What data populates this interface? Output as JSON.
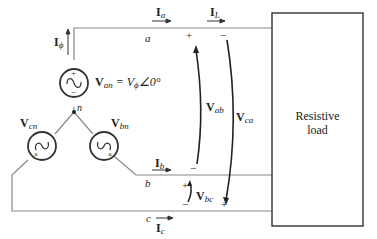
{
  "diagram": {
    "load_label_line1": "Resistive",
    "load_label_line2": "load",
    "node_a": "a",
    "node_b": "b",
    "node_c": "c",
    "node_n": "n",
    "currents": {
      "I_phi": {
        "main": "I",
        "sub": "ϕ"
      },
      "I_a": {
        "main": "I",
        "sub": "a"
      },
      "I_L": {
        "main": "I",
        "sub": "L"
      },
      "I_b": {
        "main": "I",
        "sub": "b"
      },
      "I_c": {
        "main": "I",
        "sub": "c"
      }
    },
    "voltages": {
      "V_an": {
        "main": "V",
        "sub": "an",
        "eq": " = V",
        "eq_sub": "ϕ",
        "angle": "∠0°"
      },
      "V_bn": {
        "main": "V",
        "sub": "bn"
      },
      "V_cn": {
        "main": "V",
        "sub": "cn"
      },
      "V_ab": {
        "main": "V",
        "sub": "ab"
      },
      "V_ca": {
        "main": "V",
        "sub": "ca"
      },
      "V_bc": {
        "main": "V",
        "sub": "bc"
      }
    },
    "signs": {
      "plus": "+",
      "minus": "−"
    },
    "colors": {
      "wire": "#888888",
      "stroke": "#333333",
      "text": "#222222"
    }
  }
}
